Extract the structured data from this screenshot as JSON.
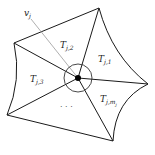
{
  "diagram": {
    "vertex_label": {
      "main": "v",
      "sub": "j"
    },
    "triangles": [
      {
        "main": "T",
        "sub": "j,1"
      },
      {
        "main": "T",
        "sub": "j,2"
      },
      {
        "main": "T",
        "sub": "j,3"
      },
      {
        "main": "T",
        "sub": "j,m",
        "subsub": "j"
      }
    ],
    "ellipsis": "· · ·",
    "colors": {
      "edge": "#1a1a1a",
      "pointer": "#9a9a9a",
      "center": "#000000"
    }
  }
}
